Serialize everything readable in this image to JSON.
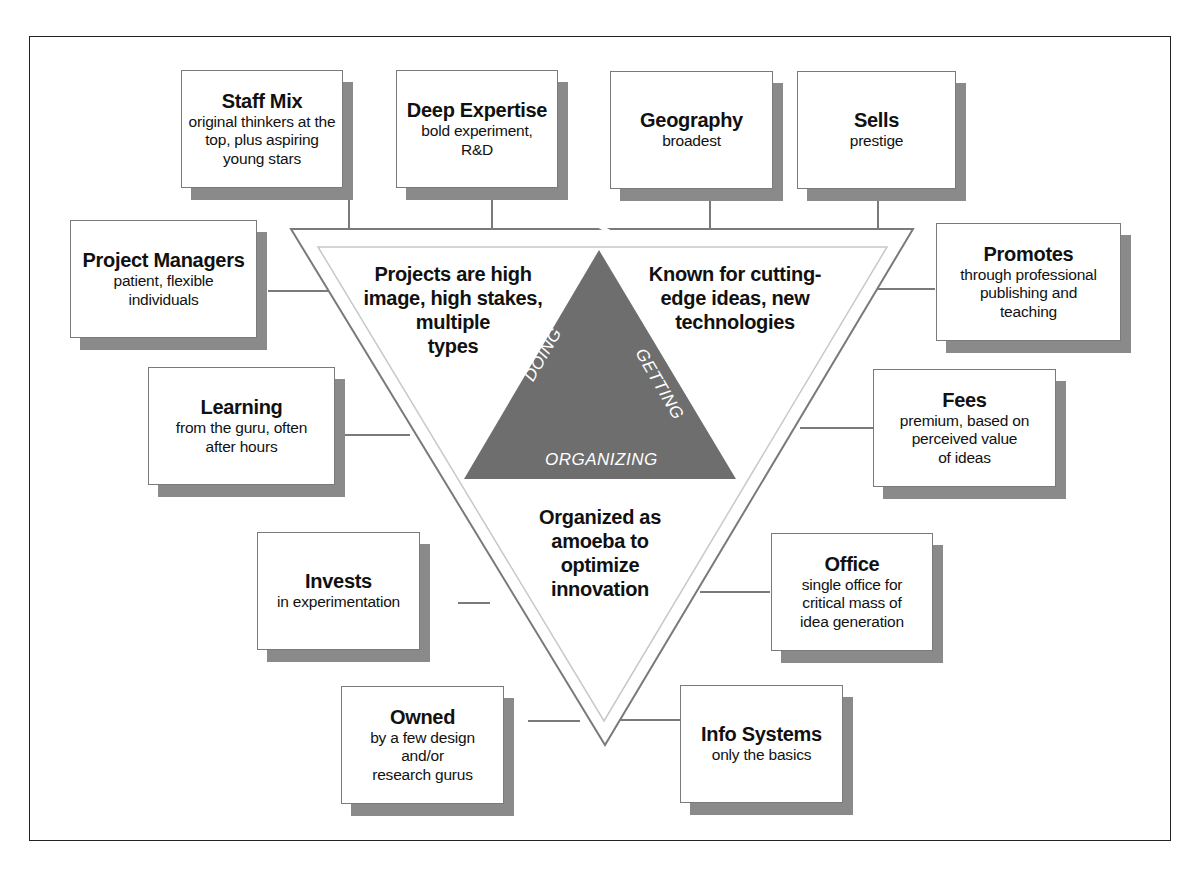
{
  "diagram": {
    "boxes": [
      {
        "id": "staff-mix",
        "title": "Staff Mix",
        "subtitle": "original thinkers at the\ntop, plus aspiring\nyoung stars"
      },
      {
        "id": "deep-expertise",
        "title": "Deep Expertise",
        "subtitle": "bold experiment,\nR&D"
      },
      {
        "id": "geography",
        "title": "Geography",
        "subtitle": "broadest"
      },
      {
        "id": "sells",
        "title": "Sells",
        "subtitle": "prestige"
      },
      {
        "id": "project-managers",
        "title": "Project Managers",
        "subtitle": "patient, flexible\nindividuals"
      },
      {
        "id": "promotes",
        "title": "Promotes",
        "subtitle": "through professional\npublishing and\nteaching"
      },
      {
        "id": "learning",
        "title": "Learning",
        "subtitle": "from the guru, often\nafter hours"
      },
      {
        "id": "fees",
        "title": "Fees",
        "subtitle": "premium, based on\nperceived value\nof ideas"
      },
      {
        "id": "invests",
        "title": "Invests",
        "subtitle": "in experimentation"
      },
      {
        "id": "office",
        "title": "Office",
        "subtitle": "single office for\ncritical mass of\nidea generation"
      },
      {
        "id": "owned",
        "title": "Owned",
        "subtitle": "by a few design and/or\nresearch gurus"
      },
      {
        "id": "info-systems",
        "title": "Info Systems",
        "subtitle": "only the basics"
      }
    ],
    "center": {
      "top_left": "Projects are high\nimage, high stakes,\nmultiple\ntypes",
      "top_right": "Known for cutting-\nedge ideas, new\ntechnologies",
      "bottom": "Organized as\namoeba to\noptimize\ninnovation"
    },
    "inner_triangle": {
      "left_label": "DOING",
      "right_label": "GETTING",
      "bottom_label": "ORGANIZING",
      "fill_color": "#6e6e6e"
    },
    "colors": {
      "box_border": "#7a7a7a",
      "shadow": "#8a8a8a",
      "line": "#7a7a7a",
      "frame": "#222222"
    }
  }
}
